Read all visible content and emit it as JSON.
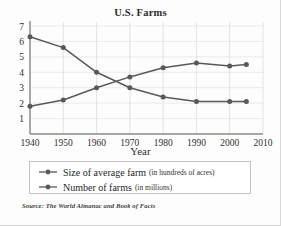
{
  "figure": {
    "title": "U.S. Farms",
    "source_note": "Source: The World Almanac and Book of Facts",
    "axis_title_x": "Year"
  },
  "legend": {
    "entries": [
      {
        "marker": "line-dot-marker",
        "main": "Size of average farm",
        "sub": "(in hundreds of acres)"
      },
      {
        "marker": "line-dot-marker",
        "main": "Number of farms",
        "sub": "(in millions)"
      }
    ]
  },
  "chart_data": {
    "type": "line",
    "title": "U.S. Farms",
    "xlabel": "Year",
    "ylabel": "",
    "xlim": [
      1940,
      2010
    ],
    "ylim": [
      0,
      7
    ],
    "xticks": [
      1940,
      1950,
      1960,
      1970,
      1980,
      1990,
      2000,
      2010
    ],
    "yticks": [
      1,
      2,
      3,
      4,
      5,
      6,
      7
    ],
    "grid": "vertical gridlines at each decade, faint horizontal gridlines",
    "legend_position": "below plot",
    "x": [
      1940,
      1950,
      1960,
      1970,
      1980,
      1990,
      2000,
      2005
    ],
    "series": [
      {
        "name": "Size of average farm (in hundreds of acres)",
        "values": [
          1.8,
          2.2,
          3.0,
          3.7,
          4.3,
          4.6,
          4.4,
          4.5
        ],
        "color": "#595959"
      },
      {
        "name": "Number of farms (in millions)",
        "values": [
          6.3,
          5.6,
          4.0,
          3.0,
          2.4,
          2.1,
          2.1,
          2.1
        ],
        "color": "#595959"
      }
    ],
    "colors": {
      "line": "#595959",
      "grid": "#e3e3e3",
      "axis": "#8a8a8a",
      "text": "#2f2f2f"
    }
  }
}
